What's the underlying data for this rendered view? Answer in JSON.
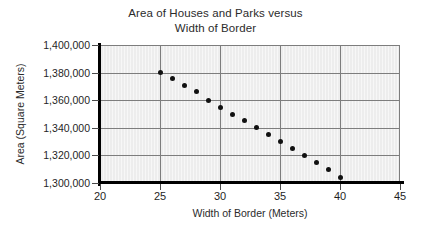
{
  "chart_data": {
    "type": "scatter",
    "title": "Area of Houses and Parks versus Width of Border",
    "title_lines": [
      "Area of Houses and Parks versus",
      "Width of Border"
    ],
    "xlabel": "Width of Border (Meters)",
    "ylabel": "Area (Square Meters)",
    "xlim": [
      20,
      45
    ],
    "ylim": [
      1300000,
      1400000
    ],
    "xticks": [
      20,
      25,
      30,
      35,
      40,
      45
    ],
    "xtick_labels": [
      "20",
      "25",
      "30",
      "35",
      "40",
      "45"
    ],
    "yticks": [
      1300000,
      1320000,
      1340000,
      1360000,
      1380000,
      1400000
    ],
    "ytick_labels": [
      "1,300,000",
      "1,320,000",
      "1,340,000",
      "1,360,000",
      "1,380,000",
      "1,400,000"
    ],
    "grid": true,
    "legend": null,
    "x": [
      25,
      26,
      27,
      28,
      29,
      30,
      31,
      32,
      33,
      34,
      35,
      36,
      37,
      38,
      39,
      40
    ],
    "y": [
      1380000,
      1376000,
      1371000,
      1366000,
      1360000,
      1355000,
      1350000,
      1345000,
      1340000,
      1335000,
      1330000,
      1325000,
      1320000,
      1315000,
      1310000,
      1304000
    ],
    "marker": "filled-circle",
    "marker_color": "#111111",
    "plot_background": "#ededed",
    "axis_color": "#000000",
    "grid_color": "#7d7d7d"
  }
}
